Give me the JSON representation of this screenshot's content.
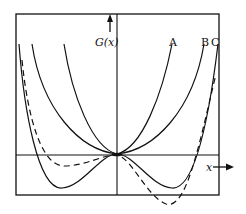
{
  "figure": {
    "y_axis_label": "G(x)",
    "x_axis_label": "x",
    "curve_labels": [
      "A",
      "B",
      "C"
    ],
    "dashed_curve_label": "",
    "colors": {
      "ink": "#111111",
      "background": "#ffffff"
    }
  },
  "curves": [
    {
      "name": "A",
      "style": "solid",
      "shape": "single minimum at origin, narrow"
    },
    {
      "name": "B",
      "style": "solid",
      "shape": "single minimum at origin, wide/flat"
    },
    {
      "name": "C",
      "style": "solid",
      "shape": "double well, symmetric minima below axis"
    },
    {
      "name": "dashed",
      "style": "dashed",
      "shape": "asymmetric double well, deeper right minimum"
    }
  ]
}
